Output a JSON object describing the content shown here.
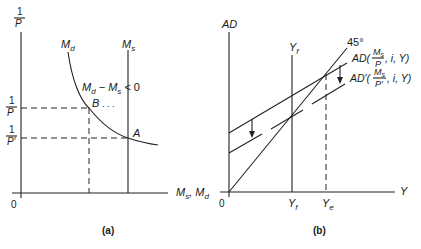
{
  "panel_a": {
    "caption": "(a)",
    "y_axis_label_num": "1",
    "y_axis_label_den": "P",
    "x_axis_label": "M",
    "x_axis_label_sub1": "s",
    "x_axis_label_mid": ", M",
    "x_axis_label_sub2": "d",
    "origin": "0",
    "md_curve_label": "M",
    "md_curve_sub": "d",
    "ms_line_label": "M",
    "ms_line_sub": "s",
    "excess_label_m1": "M",
    "excess_label_s1": "d",
    "excess_label_mid": " − M",
    "excess_label_s2": "s",
    "excess_label_end": " < 0",
    "point_b": "B",
    "point_b_dots": ". . .",
    "point_a": "A",
    "tick_1_num": "1",
    "tick_1_den": "P",
    "tick_2_num": "1",
    "tick_2_den": "P′"
  },
  "panel_b": {
    "caption": "(b)",
    "y_axis_label": "AD",
    "x_axis_label": "Y",
    "origin": "0",
    "yf_top_label": "Y",
    "yf_top_sub": "f",
    "yf_tick": "Y",
    "yf_tick_sub": "f",
    "ye_tick": "Y",
    "ye_tick_sub": "e",
    "deg45_label": "45°",
    "ad_label_prefix": "AD(",
    "ad_label_frac_num": "M",
    "ad_label_frac_num_sub": "s",
    "ad_label_frac_den": "P",
    "ad_label_suffix": ", i, Y)",
    "adp_label_prefix": "AD′(",
    "adp_label_frac_num": "M",
    "adp_label_frac_num_sub": "s",
    "adp_label_frac_den": "P′",
    "adp_label_suffix": ", i, Y)"
  }
}
